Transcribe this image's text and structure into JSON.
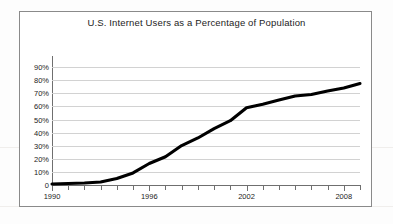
{
  "figure": {
    "title": "U.S. Internet Users as a Percentage of Population",
    "frame_color": "#8a8a8a",
    "background": "#ffffff"
  },
  "axes": {
    "y_tick_labels": [
      "90%",
      "80%",
      "70%",
      "60%",
      "50%",
      "40%",
      "30%",
      "20%",
      "10%",
      "0"
    ],
    "x_tick_labels": [
      "1990",
      "1996",
      "2002",
      "2008"
    ]
  },
  "chart_data": {
    "type": "line",
    "title": "U.S. Internet Users as a Percentage of Population",
    "xlabel": "",
    "ylabel": "",
    "xlim": [
      1990,
      2009
    ],
    "ylim": [
      0,
      90
    ],
    "grid": true,
    "legend": "none",
    "line_color": "#000000",
    "x": [
      1990,
      1991,
      1992,
      1993,
      1994,
      1995,
      1996,
      1997,
      1998,
      1999,
      2000,
      2001,
      2002,
      2003,
      2004,
      2005,
      2006,
      2007,
      2008,
      2009
    ],
    "x_tick_values": [
      1990,
      1996,
      2002,
      2008
    ],
    "y_tick_values": [
      0,
      10,
      20,
      30,
      40,
      50,
      60,
      70,
      80,
      90
    ],
    "values": [
      0.8,
      1.2,
      1.5,
      2.3,
      4.9,
      9.2,
      16.4,
      21.6,
      30.1,
      35.9,
      43.1,
      49.1,
      59.0,
      61.7,
      64.8,
      68.0,
      69.1,
      71.7,
      74.0,
      77.5
    ],
    "series": [
      {
        "name": "U.S. Internet Users (% of population)",
        "values": [
          0.8,
          1.2,
          1.5,
          2.3,
          4.9,
          9.2,
          16.4,
          21.6,
          30.1,
          35.9,
          43.1,
          49.1,
          59.0,
          61.7,
          64.8,
          68.0,
          69.1,
          71.7,
          74.0,
          77.5
        ]
      }
    ]
  }
}
